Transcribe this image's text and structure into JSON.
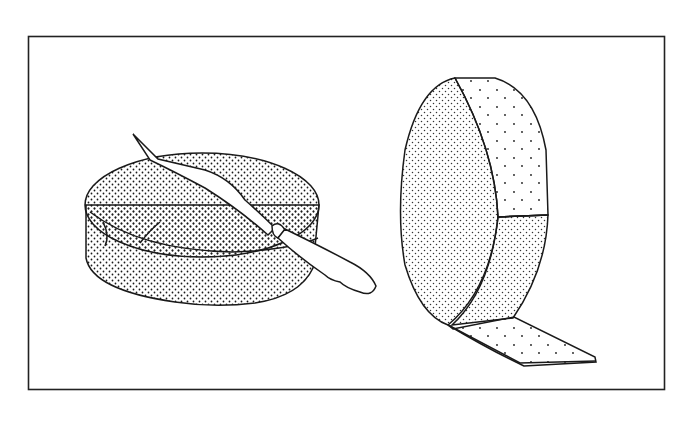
{
  "figure": {
    "colors": {
      "ink": "#1a1a1a",
      "paper": "#ffffff"
    },
    "items": [
      {
        "name": "round-cheese-with-knife",
        "label": "Round cheese with spreading knife"
      },
      {
        "name": "standing-cheese-wheel-peeled-rind",
        "label": "Cheese wheel with peeled rind strip"
      }
    ]
  }
}
